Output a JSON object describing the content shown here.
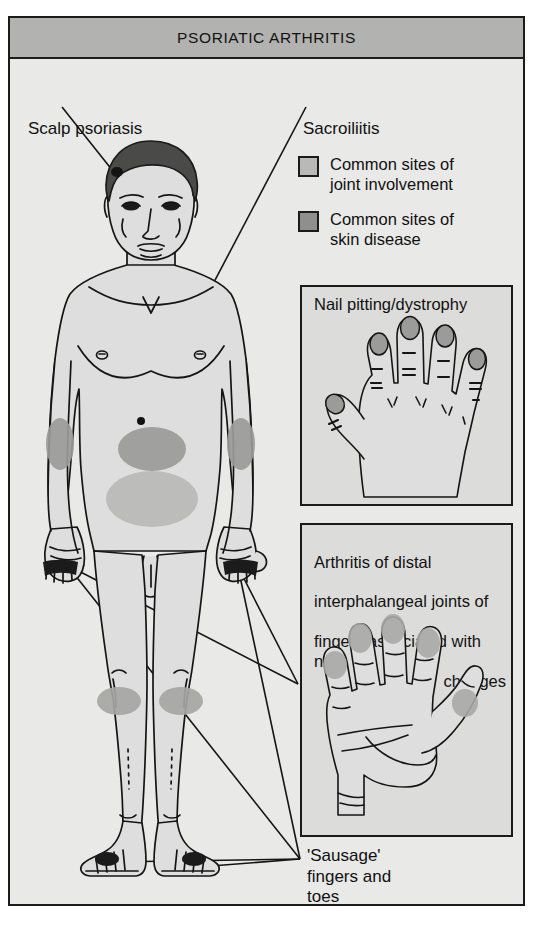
{
  "figure": {
    "title": "PSORIATIC ARTHRITIS",
    "background_color": "#e9e9e7",
    "frame_color": "#1b1b1b",
    "title_bar_color": "#b2b2b0"
  },
  "labels": {
    "scalp": "Scalp psoriasis",
    "sacroiliitis": "Sacroiliitis",
    "sausage": "'Sausage'\nfingers and\ntoes"
  },
  "legend": {
    "items": [
      {
        "text": "Common sites of\njoint involvement",
        "color": "#b9b9b7",
        "swatch_name": "joint-involvement-swatch"
      },
      {
        "text": "Common sites of\nskin disease",
        "color": "#8f8f8d",
        "swatch_name": "skin-disease-swatch"
      }
    ]
  },
  "panels": [
    {
      "id": "nail",
      "caption": "Nail pitting/dystrophy",
      "illustration": "dorsal-hand-with-pitted-nails",
      "nail_color": "#9b9b99"
    },
    {
      "id": "dip",
      "caption_lines": [
        "Arthritis of distal",
        "interphalangeal joints of",
        "fingers associated with nail"
      ],
      "caption_last_line": "changes",
      "illustration": "palmar-hand-with-dip-joint-swelling",
      "joint_color": "#a9a9a7"
    }
  ],
  "body_figure": {
    "description": "anterior view of standing male figure",
    "skin_fill": "#dedede",
    "hair_color": "#4a4a48",
    "joint_site_color": "#b9b9b7",
    "skin_site_color": "#9a9a98",
    "lesion_color": "#111111",
    "marked_regions": [
      {
        "name": "scalp-lesion",
        "type": "skin-disease"
      },
      {
        "name": "left-elbow-patch",
        "type": "skin-disease"
      },
      {
        "name": "right-elbow-patch",
        "type": "skin-disease"
      },
      {
        "name": "upper-abdomen-patch",
        "type": "skin-disease"
      },
      {
        "name": "sacroiliac-patch",
        "type": "joint-involvement"
      },
      {
        "name": "left-knee-patch",
        "type": "skin-disease"
      },
      {
        "name": "right-knee-patch",
        "type": "skin-disease"
      },
      {
        "name": "left-hand-fingertips",
        "type": "joint-involvement"
      },
      {
        "name": "right-hand-fingertips",
        "type": "joint-involvement"
      },
      {
        "name": "left-foot-toes",
        "type": "joint-involvement"
      },
      {
        "name": "right-foot-toes",
        "type": "joint-involvement"
      }
    ]
  }
}
